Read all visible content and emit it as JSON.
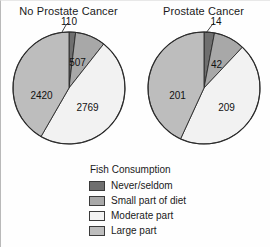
{
  "figure": {
    "legend_title": "Fish Consumption"
  },
  "colors": {
    "never_seldom": "#6f6f6f",
    "small_part": "#a8a8a8",
    "moderate_part": "#f2f2f2",
    "large_part": "#bdbdbd",
    "outline": "#2b2b2b",
    "text": "#111111"
  },
  "legend": {
    "title": "Fish Consumption",
    "items": [
      {
        "label": "Never/seldom",
        "color": "#6f6f6f"
      },
      {
        "label": "Small part of diet",
        "color": "#a8a8a8"
      },
      {
        "label": "Moderate part",
        "color": "#f2f2f2"
      },
      {
        "label": "Large part",
        "color": "#bdbdbd"
      }
    ]
  },
  "charts": [
    {
      "id": "no-prostate-cancer",
      "title": "No Prostate Cancer",
      "total": 5806,
      "labels": [
        "110",
        "507",
        "2769",
        "2420"
      ]
    },
    {
      "id": "prostate-cancer",
      "title": "Prostate Cancer",
      "total": 466,
      "labels": [
        "14",
        "42",
        "209",
        "201"
      ]
    }
  ],
  "chart_data": {
    "type": "pie",
    "legend_title": "Fish Consumption",
    "legend_position": "bottom",
    "categories": [
      "Never/seldom",
      "Small part of diet",
      "Moderate part",
      "Large part"
    ],
    "colors": [
      "#6f6f6f",
      "#a8a8a8",
      "#f2f2f2",
      "#bdbdbd"
    ],
    "start_angle_deg": 0,
    "direction": "clockwise",
    "charts": [
      {
        "title": "No Prostate Cancer",
        "values": [
          110,
          507,
          2769,
          2420
        ],
        "labels": [
          "110",
          "507",
          "2769",
          "2420"
        ],
        "total": 5806,
        "percentages": [
          1.9,
          8.7,
          47.7,
          41.7
        ]
      },
      {
        "title": "Prostate Cancer",
        "values": [
          14,
          42,
          209,
          201
        ],
        "labels": [
          "14",
          "42",
          "209",
          "201"
        ],
        "total": 466,
        "percentages": [
          3.0,
          9.0,
          44.8,
          43.1
        ]
      }
    ]
  }
}
